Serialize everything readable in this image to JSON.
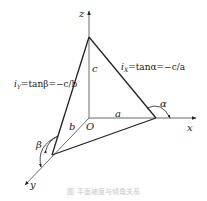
{
  "diagram": {
    "axes": {
      "x_label": "x",
      "y_label": "y",
      "z_label": "z",
      "origin_label": "O"
    },
    "segments": {
      "a_label": "a",
      "b_label": "b",
      "c_label": "c"
    },
    "angles": {
      "alpha_label": "α",
      "beta_label": "β"
    },
    "formulas": {
      "ix": {
        "lhs": "i",
        "sub": "X",
        "rhs": "=tanα=−c/a"
      },
      "iy": {
        "lhs": "i",
        "sub": "Y",
        "rhs": "=tanβ=−c/b"
      }
    },
    "caption": "图 平面坡度与倾角关系"
  }
}
